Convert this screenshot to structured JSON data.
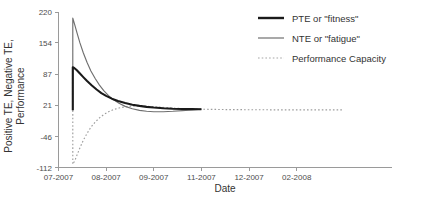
{
  "chart_data": {
    "type": "line",
    "title": "",
    "xlabel": "Date",
    "ylabel": "Positive TE, Negative TE,\nPerformance",
    "ylabel_line1": "Positive TE, Negative TE,",
    "ylabel_line2": "Performance",
    "grid": false,
    "legend_position": "top-right",
    "xlim": [
      0,
      7
    ],
    "ylim": [
      -112,
      220
    ],
    "x_tick_labels": [
      "07-2007",
      "08-2007",
      "09-2007",
      "11-2007",
      "12-2007",
      "02-2008"
    ],
    "x_tick_positions": [
      0,
      1,
      2,
      3,
      4,
      5
    ],
    "y_tick_labels": [
      "220",
      "154",
      "87",
      "21",
      "-46",
      "-112"
    ],
    "y_tick_values": [
      220,
      154,
      87,
      21,
      -46,
      -112
    ],
    "series": [
      {
        "name": "PTE or \"fitness\"",
        "key": "pte",
        "style": "solid-thick",
        "color": "#1a1a1a",
        "points": [
          [
            0.3,
            10.0
          ],
          [
            0.3,
            102.0
          ],
          [
            0.33,
            100.5
          ],
          [
            0.38,
            96.0
          ],
          [
            0.45,
            88.5
          ],
          [
            0.52,
            81.0
          ],
          [
            0.6,
            72.5
          ],
          [
            0.7,
            63.0
          ],
          [
            0.8,
            54.5
          ],
          [
            0.9,
            47.0
          ],
          [
            1.0,
            41.0
          ],
          [
            1.12,
            35.0
          ],
          [
            1.25,
            30.0
          ],
          [
            1.4,
            25.5
          ],
          [
            1.55,
            22.0
          ],
          [
            1.7,
            19.5
          ],
          [
            1.85,
            17.5
          ],
          [
            2.0,
            16.0
          ],
          [
            2.2,
            14.5
          ],
          [
            2.4,
            13.5
          ],
          [
            2.6,
            13.0
          ],
          [
            2.8,
            12.6
          ],
          [
            3.0,
            12.3
          ]
        ]
      },
      {
        "name": "NTE or \"fatigue\"",
        "key": "nte",
        "style": "solid-thin",
        "color": "#6f6f6f",
        "points": [
          [
            0.3,
            10.0
          ],
          [
            0.3,
            207.0
          ],
          [
            0.34,
            193.0
          ],
          [
            0.39,
            175.0
          ],
          [
            0.45,
            154.0
          ],
          [
            0.52,
            133.0
          ],
          [
            0.6,
            112.0
          ],
          [
            0.68,
            94.0
          ],
          [
            0.77,
            78.0
          ],
          [
            0.86,
            64.0
          ],
          [
            0.95,
            52.0
          ],
          [
            1.05,
            41.5
          ],
          [
            1.15,
            33.0
          ],
          [
            1.27,
            25.0
          ],
          [
            1.4,
            18.5
          ],
          [
            1.55,
            13.5
          ],
          [
            1.7,
            10.0
          ],
          [
            1.85,
            8.0
          ],
          [
            2.0,
            7.0
          ],
          [
            2.2,
            7.0
          ],
          [
            2.4,
            8.0
          ],
          [
            2.6,
            9.5
          ],
          [
            2.8,
            11.0
          ],
          [
            3.0,
            12.3
          ]
        ]
      },
      {
        "name": "Performance Capacity",
        "key": "perf",
        "style": "dotted",
        "color": "#9d9d9d",
        "points": [
          [
            0.3,
            10.0
          ],
          [
            0.3,
            -105.0
          ],
          [
            0.34,
            -98.0
          ],
          [
            0.39,
            -85.0
          ],
          [
            0.45,
            -70.0
          ],
          [
            0.52,
            -54.0
          ],
          [
            0.6,
            -39.0
          ],
          [
            0.68,
            -26.0
          ],
          [
            0.77,
            -15.0
          ],
          [
            0.86,
            -6.0
          ],
          [
            0.95,
            1.0
          ],
          [
            1.05,
            7.0
          ],
          [
            1.15,
            11.5
          ],
          [
            1.27,
            15.0
          ],
          [
            1.4,
            17.5
          ],
          [
            1.52,
            19.0
          ],
          [
            1.65,
            19.5
          ],
          [
            1.8,
            19.0
          ],
          [
            1.95,
            18.0
          ],
          [
            2.1,
            17.0
          ],
          [
            2.3,
            15.5
          ],
          [
            2.5,
            14.3
          ],
          [
            2.7,
            13.4
          ],
          [
            3.0,
            12.5
          ],
          [
            3.4,
            11.8
          ],
          [
            3.9,
            11.4
          ],
          [
            4.4,
            11.2
          ],
          [
            5.0,
            11.1
          ],
          [
            5.6,
            11.0
          ],
          [
            5.95,
            11.0
          ]
        ]
      }
    ],
    "legend": [
      {
        "label": "PTE or \"fitness\"",
        "style": "solid-thick",
        "color": "#1a1a1a"
      },
      {
        "label": "NTE or \"fatigue\"",
        "style": "solid-thin",
        "color": "#6f6f6f"
      },
      {
        "label": "Performance Capacity",
        "style": "dotted",
        "color": "#9d9d9d"
      }
    ]
  },
  "colors": {
    "axis": "#9a9a9a",
    "text": "#333333",
    "tick_text": "#4d4d4d",
    "background": "#ffffff"
  }
}
